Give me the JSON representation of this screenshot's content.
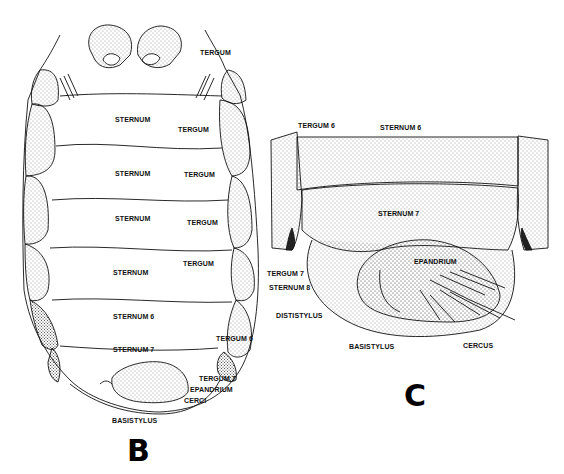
{
  "panels": {
    "B": {
      "letter": "B",
      "labels": {
        "tergum_top": "TERGUM",
        "sternum_1": "STERNUM",
        "tergum_1": "TERGUM",
        "sternum_2": "STERNUM",
        "tergum_2": "TERGUM",
        "sternum_3": "STERNUM",
        "tergum_3": "TERGUM",
        "sternum_4": "STERNUM",
        "tergum_4": "TERGUM",
        "sternum_6": "STERNUM 6",
        "tergum_6": "TERGUM 6",
        "sternum_7": "STERNUM 7",
        "tergum_7": "TERGUM 7",
        "epandrium": "EPANDRIUM",
        "cerci": "CERCI",
        "basistylus": "BASISTYLUS"
      }
    },
    "C": {
      "letter": "C",
      "labels": {
        "tergum_6": "TERGUM 6",
        "sternum_6": "STERNUM 6",
        "sternum_7": "STERNUM 7",
        "epandrium": "EPANDRIUM",
        "tergum_7": "TERGUM 7",
        "sternum_8": "STERNUM 8",
        "dististylus": "DISTISTYLUS",
        "basistylus": "BASISTYLUS",
        "cercus": "CERCUS"
      }
    }
  }
}
